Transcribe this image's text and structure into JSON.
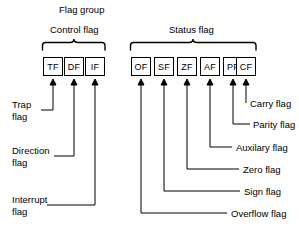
{
  "diagram": {
    "title": "Flag group",
    "groups": [
      {
        "id": "control",
        "label": "Control flag"
      },
      {
        "id": "status",
        "label": "Status flag"
      }
    ],
    "boxes": [
      {
        "id": "tf",
        "label": "TF",
        "group": "control"
      },
      {
        "id": "df",
        "label": "DF",
        "group": "control"
      },
      {
        "id": "if",
        "label": "IF",
        "group": "control"
      },
      {
        "id": "of",
        "label": "OF",
        "group": "status"
      },
      {
        "id": "sf",
        "label": "SF",
        "group": "status"
      },
      {
        "id": "zf",
        "label": "ZF",
        "group": "status"
      },
      {
        "id": "af",
        "label": "AF",
        "group": "status"
      },
      {
        "id": "pf",
        "label": "PF",
        "group": "status"
      },
      {
        "id": "cf",
        "label": "CF",
        "group": "status"
      }
    ],
    "left_labels": [
      {
        "id": "trap",
        "line1": "Trap",
        "line2": "flag"
      },
      {
        "id": "direction",
        "line1": "Direction",
        "line2": "flag"
      },
      {
        "id": "interrupt",
        "line1": "Interrupt",
        "line2": "flag"
      }
    ],
    "right_labels": [
      {
        "id": "carry",
        "text": "Carry flag"
      },
      {
        "id": "parity",
        "text": "Parity flag"
      },
      {
        "id": "auxilary",
        "text": "Auxilary flag"
      },
      {
        "id": "zero",
        "text": "Zero flag"
      },
      {
        "id": "sign",
        "text": "Sign flag"
      },
      {
        "id": "overflow",
        "text": "Overflow flag"
      }
    ],
    "colors": {
      "stroke": "#000000",
      "background": "#ffffff",
      "text": "#000000"
    }
  }
}
